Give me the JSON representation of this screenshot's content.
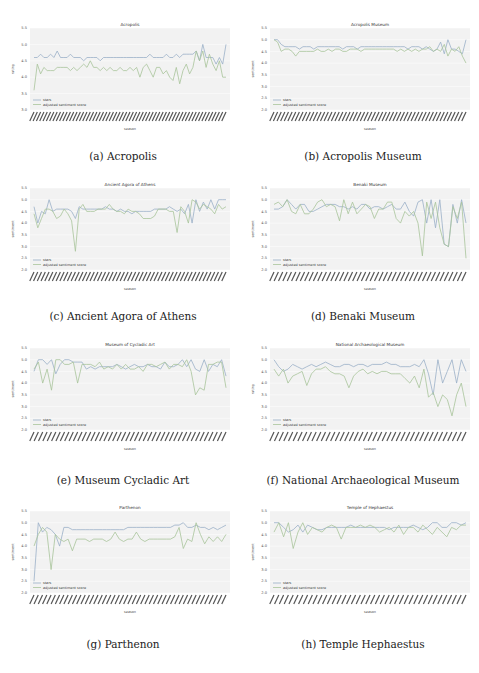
{
  "figure": {
    "panels": [
      {
        "id": "a",
        "caption": "(a) Acropolis",
        "title": "Acropolis",
        "ylabel": "rating",
        "xlabel": "season",
        "legend": [
          "stars",
          "adjusted sentiment score"
        ]
      },
      {
        "id": "b",
        "caption": "(b) Acropolis Museum",
        "title": "Acropolis Museum",
        "ylabel": "sentiment",
        "xlabel": "season",
        "legend": [
          "stars",
          "adjusted sentiment score"
        ]
      },
      {
        "id": "c",
        "caption": "(c) Ancient Agora of Athens",
        "title": "Ancient Agora of Athens",
        "ylabel": "sentiment",
        "xlabel": "season",
        "legend": [
          "stars",
          "adjusted sentiment score"
        ]
      },
      {
        "id": "d",
        "caption": "(d) Benaki Museum",
        "title": "Benaki Museum",
        "ylabel": "sentiment",
        "xlabel": "season",
        "legend": [
          "stars",
          "adjusted sentiment score"
        ]
      },
      {
        "id": "e",
        "caption": "(e) Museum Cycladic Art",
        "title": "Museum of Cycladic Art",
        "ylabel": "sentiment",
        "xlabel": "season",
        "legend": [
          "stars",
          "adjusted sentiment score"
        ]
      },
      {
        "id": "f",
        "caption": "(f) National Archaeological Museum",
        "title": "National Archaeological Museum",
        "ylabel": "rating",
        "xlabel": "season",
        "legend": [
          "stars",
          "adjusted sentiment score"
        ]
      },
      {
        "id": "g",
        "caption": "(g) Parthenon",
        "title": "Parthenon",
        "ylabel": "sentiment",
        "xlabel": "season",
        "legend": [
          "stars",
          "adjusted sentiment score"
        ]
      },
      {
        "id": "h",
        "caption": "(h) Temple Hephaestus",
        "title": "Temple of Hephaestus",
        "ylabel": "sentiment",
        "xlabel": "season",
        "legend": [
          "stars",
          "adjusted sentiment score"
        ]
      }
    ],
    "colors": {
      "stars": "#9ab0c8",
      "sentiment": "#a8c49a",
      "plot_bg": "#f2f2f2",
      "grid": "#ffffff"
    }
  },
  "chart_data": [
    {
      "type": "line",
      "title": "Acropolis",
      "xlabel": "season",
      "ylabel": "rating",
      "ylim": [
        3.0,
        5.5
      ],
      "yticks": [
        3.0,
        3.5,
        4.0,
        4.5,
        5.0,
        5.5
      ],
      "grid": true,
      "legend_position": "lower left",
      "series": [
        {
          "name": "stars",
          "values": [
            4.6,
            4.6,
            4.7,
            4.6,
            4.6,
            4.7,
            4.6,
            4.8,
            4.6,
            4.6,
            4.6,
            4.7,
            4.6,
            4.6,
            4.6,
            4.5,
            4.6,
            4.6,
            4.6,
            4.6,
            4.5,
            4.6,
            4.6,
            4.6,
            4.6,
            4.6,
            4.6,
            4.6,
            4.6,
            4.6,
            4.6,
            4.6,
            4.6,
            4.6,
            4.6,
            4.7,
            4.6,
            4.6,
            4.6,
            4.6,
            4.7,
            4.6,
            4.6,
            4.7,
            4.6,
            4.7,
            4.7,
            4.7,
            4.7,
            4.8,
            4.5,
            5.0,
            4.6,
            4.6,
            4.6,
            4.4,
            4.6,
            4.4,
            5.0
          ]
        },
        {
          "name": "adjusted sentiment score",
          "values": [
            3.6,
            4.4,
            4.1,
            4.3,
            4.2,
            4.2,
            4.2,
            4.3,
            4.3,
            4.3,
            4.3,
            4.2,
            4.3,
            4.2,
            4.3,
            4.4,
            4.3,
            4.5,
            4.3,
            4.3,
            4.2,
            4.3,
            4.2,
            4.3,
            4.2,
            4.2,
            4.3,
            4.2,
            4.2,
            4.3,
            4.2,
            4.3,
            4.0,
            4.3,
            4.4,
            4.2,
            4.0,
            4.3,
            4.3,
            4.1,
            4.2,
            4.0,
            3.9,
            4.3,
            3.8,
            4.2,
            4.4,
            4.1,
            4.3,
            4.8,
            4.5,
            4.8,
            4.3,
            4.7,
            4.4,
            4.2,
            4.5,
            4.0,
            4.0
          ]
        }
      ]
    },
    {
      "type": "line",
      "title": "Acropolis Museum",
      "xlabel": "season",
      "ylabel": "sentiment",
      "ylim": [
        2.0,
        5.5
      ],
      "yticks": [
        2.0,
        2.5,
        3.0,
        3.5,
        4.0,
        4.5,
        5.0,
        5.5
      ],
      "grid": true,
      "legend_position": "lower left",
      "series": [
        {
          "name": "stars",
          "values": [
            5.0,
            5.0,
            4.8,
            4.7,
            4.7,
            4.7,
            4.7,
            4.6,
            4.7,
            4.7,
            4.7,
            4.6,
            4.7,
            4.7,
            4.7,
            4.7,
            4.7,
            4.7,
            4.7,
            4.6,
            4.7,
            4.7,
            4.7,
            4.6,
            4.7,
            4.7,
            4.7,
            4.7,
            4.7,
            4.7,
            4.7,
            4.7,
            4.7,
            4.7,
            4.7,
            4.7,
            4.7,
            4.6,
            4.7,
            4.7,
            4.7,
            4.6,
            4.7,
            4.6,
            4.5,
            4.6,
            4.9,
            4.4,
            5.0,
            4.6,
            4.6,
            4.5,
            4.4,
            5.0
          ]
        },
        {
          "name": "adjusted sentiment score",
          "values": [
            5.0,
            4.9,
            4.5,
            4.6,
            4.6,
            4.5,
            4.3,
            4.5,
            4.5,
            4.5,
            4.5,
            4.5,
            4.6,
            4.5,
            4.5,
            4.6,
            4.5,
            4.6,
            4.6,
            4.5,
            4.5,
            4.6,
            4.6,
            4.6,
            4.5,
            4.6,
            4.6,
            4.6,
            4.6,
            4.6,
            4.6,
            4.6,
            4.6,
            4.6,
            4.5,
            4.6,
            4.5,
            4.6,
            4.5,
            4.6,
            4.5,
            4.6,
            4.6,
            4.7,
            4.5,
            4.6,
            4.5,
            4.8,
            4.3,
            4.6,
            4.5,
            4.7,
            4.3,
            4.0
          ]
        }
      ]
    },
    {
      "type": "line",
      "title": "Ancient Agora of Athens",
      "xlabel": "season",
      "ylabel": "sentiment",
      "ylim": [
        2.0,
        5.5
      ],
      "yticks": [
        2.0,
        2.5,
        3.0,
        3.5,
        4.0,
        4.5,
        5.0,
        5.5
      ],
      "grid": true,
      "legend_position": "lower left",
      "series": [
        {
          "name": "stars",
          "values": [
            4.7,
            4.0,
            4.5,
            4.4,
            5.0,
            4.5,
            4.6,
            4.6,
            4.6,
            4.6,
            4.5,
            4.2,
            4.7,
            4.6,
            4.6,
            4.6,
            4.6,
            4.6,
            4.6,
            4.7,
            4.6,
            4.6,
            4.5,
            4.6,
            4.5,
            4.5,
            4.4,
            4.5,
            4.5,
            4.5,
            4.5,
            4.5,
            4.6,
            4.6,
            4.6,
            4.6,
            4.7,
            4.6,
            4.5,
            4.6,
            4.4,
            4.8,
            4.0,
            5.0,
            4.5,
            4.9,
            4.6,
            5.0,
            4.6,
            5.0,
            5.0,
            5.0
          ]
        },
        {
          "name": "adjusted sentiment score",
          "values": [
            4.4,
            3.8,
            4.2,
            4.6,
            4.6,
            4.5,
            4.2,
            4.3,
            4.6,
            4.4,
            4.1,
            2.8,
            4.6,
            4.8,
            4.5,
            4.5,
            4.5,
            4.6,
            4.6,
            4.6,
            4.8,
            4.6,
            4.5,
            4.5,
            4.4,
            4.6,
            4.5,
            4.5,
            4.4,
            4.2,
            4.2,
            4.2,
            4.3,
            4.6,
            4.6,
            4.6,
            4.5,
            4.5,
            3.6,
            4.7,
            4.5,
            4.0,
            5.0,
            4.9,
            4.6,
            4.8,
            4.7,
            4.6,
            4.4,
            4.8,
            4.6,
            4.7
          ]
        }
      ]
    },
    {
      "type": "line",
      "title": "Benaki Museum",
      "xlabel": "season",
      "ylabel": "sentiment",
      "ylim": [
        2.0,
        5.5
      ],
      "yticks": [
        2.0,
        2.5,
        3.0,
        3.5,
        4.0,
        4.5,
        5.0,
        5.5
      ],
      "grid": true,
      "legend_position": "lower left",
      "series": [
        {
          "name": "stars",
          "values": [
            4.6,
            4.6,
            4.7,
            5.0,
            4.8,
            4.6,
            4.8,
            4.8,
            4.5,
            4.5,
            4.6,
            4.7,
            4.8,
            4.8,
            4.8,
            4.7,
            4.7,
            4.6,
            4.7,
            4.6,
            4.8,
            4.8,
            4.6,
            4.7,
            4.7,
            4.6,
            4.7,
            4.8,
            4.6,
            4.6,
            4.9,
            4.5,
            4.3,
            4.9,
            5.0,
            4.0,
            5.0,
            3.8,
            5.0,
            3.1,
            3.0,
            4.8,
            4.0,
            5.0,
            4.0
          ]
        },
        {
          "name": "adjusted sentiment score",
          "values": [
            4.8,
            4.9,
            4.7,
            5.0,
            4.5,
            4.4,
            4.8,
            4.4,
            4.4,
            4.6,
            4.9,
            5.0,
            4.7,
            4.8,
            4.7,
            4.1,
            5.0,
            4.4,
            4.9,
            4.4,
            4.6,
            4.8,
            4.7,
            4.2,
            4.6,
            4.6,
            4.9,
            4.9,
            4.2,
            4.0,
            4.5,
            4.3,
            4.5,
            4.0,
            2.6,
            4.9,
            4.2,
            4.9,
            3.8,
            3.1,
            3.0,
            4.7,
            4.2,
            4.9,
            2.5
          ]
        }
      ]
    },
    {
      "type": "line",
      "title": "Museum of Cycladic Art",
      "xlabel": "season",
      "ylabel": "sentiment",
      "ylim": [
        2.0,
        5.5
      ],
      "yticks": [
        2.0,
        2.5,
        3.0,
        3.5,
        4.0,
        4.5,
        5.0,
        5.5
      ],
      "grid": true,
      "legend_position": "lower left",
      "series": [
        {
          "name": "stars",
          "values": [
            4.5,
            5.0,
            5.0,
            4.8,
            5.0,
            4.4,
            4.8,
            5.0,
            5.0,
            4.9,
            4.9,
            4.9,
            4.6,
            4.7,
            4.6,
            4.7,
            4.7,
            4.7,
            4.7,
            4.8,
            4.7,
            4.6,
            4.7,
            4.8,
            4.7,
            4.7,
            4.8,
            4.7,
            4.7,
            4.6,
            4.9,
            4.7,
            4.7,
            4.8,
            5.0,
            4.7,
            5.0,
            4.6,
            4.5,
            5.0,
            4.5,
            4.8,
            4.7,
            5.0,
            4.3
          ]
        },
        {
          "name": "adjusted sentiment score",
          "values": [
            4.6,
            4.9,
            4.0,
            4.6,
            3.7,
            5.0,
            5.0,
            4.8,
            4.8,
            4.9,
            4.0,
            4.8,
            4.8,
            4.8,
            4.7,
            4.9,
            4.6,
            4.7,
            4.6,
            4.8,
            4.6,
            4.8,
            4.6,
            4.6,
            4.7,
            4.5,
            4.8,
            4.8,
            4.7,
            4.8,
            4.9,
            4.6,
            4.8,
            4.8,
            4.7,
            5.0,
            4.5,
            3.5,
            3.8,
            3.7,
            4.8,
            4.8,
            4.9,
            4.9,
            3.8
          ]
        }
      ]
    },
    {
      "type": "line",
      "title": "National Archaeological Museum",
      "xlabel": "season",
      "ylabel": "rating",
      "ylim": [
        2.0,
        5.5
      ],
      "yticks": [
        2.0,
        2.5,
        3.0,
        3.5,
        4.0,
        4.5,
        5.0,
        5.5
      ],
      "grid": true,
      "legend_position": "lower left",
      "series": [
        {
          "name": "stars",
          "values": [
            5.0,
            4.7,
            4.5,
            4.6,
            4.8,
            4.7,
            4.6,
            4.7,
            4.8,
            4.7,
            4.8,
            4.9,
            4.8,
            4.7,
            4.7,
            4.8,
            4.8,
            4.7,
            4.8,
            4.8,
            4.7,
            4.8,
            4.8,
            4.8,
            4.9,
            4.8,
            4.8,
            4.7,
            4.7,
            4.7,
            4.8,
            4.7,
            5.0,
            4.4,
            3.5,
            5.0,
            4.0,
            4.5,
            5.0,
            4.0,
            5.0,
            4.5
          ]
        },
        {
          "name": "adjusted sentiment score",
          "values": [
            4.6,
            4.3,
            4.6,
            4.0,
            4.3,
            4.4,
            4.5,
            3.9,
            4.4,
            4.6,
            4.6,
            4.7,
            4.5,
            4.4,
            4.4,
            4.3,
            3.8,
            4.3,
            4.5,
            4.6,
            4.4,
            4.5,
            4.4,
            4.5,
            4.5,
            4.4,
            4.4,
            4.4,
            4.2,
            4.0,
            4.3,
            3.8,
            4.6,
            3.4,
            3.6,
            3.0,
            3.5,
            3.3,
            2.6,
            3.5,
            4.0,
            3.0
          ]
        }
      ]
    },
    {
      "type": "line",
      "title": "Parthenon",
      "xlabel": "season",
      "ylabel": "sentiment",
      "ylim": [
        2.0,
        5.5
      ],
      "yticks": [
        2.0,
        2.5,
        3.0,
        3.5,
        4.0,
        4.5,
        5.0,
        5.5
      ],
      "grid": true,
      "legend_position": "lower left",
      "series": [
        {
          "name": "stars",
          "values": [
            2.5,
            5.0,
            4.6,
            4.8,
            4.7,
            4.5,
            4.0,
            4.8,
            4.8,
            4.7,
            4.7,
            4.7,
            4.7,
            4.7,
            4.7,
            4.7,
            4.7,
            4.7,
            4.7,
            4.7,
            4.7,
            4.7,
            4.8,
            4.8,
            4.8,
            4.8,
            4.8,
            4.8,
            4.8,
            4.8,
            4.8,
            4.8,
            4.8,
            4.9,
            4.9,
            5.0,
            4.8,
            4.8,
            4.9,
            4.8,
            4.8,
            4.7,
            4.8,
            4.7,
            4.8,
            4.9
          ]
        },
        {
          "name": "adjusted sentiment score",
          "values": [
            4.0,
            4.5,
            4.8,
            4.6,
            3.0,
            4.5,
            4.3,
            4.2,
            4.3,
            3.8,
            4.3,
            4.3,
            4.3,
            4.2,
            4.3,
            4.3,
            4.3,
            4.2,
            4.3,
            4.6,
            4.3,
            4.2,
            4.3,
            4.3,
            4.6,
            4.3,
            4.2,
            4.3,
            4.3,
            4.3,
            4.3,
            4.3,
            4.3,
            4.4,
            4.8,
            3.9,
            4.3,
            4.2,
            5.0,
            4.5,
            4.1,
            4.4,
            4.2,
            4.4,
            4.2,
            4.5
          ]
        }
      ]
    },
    {
      "type": "line",
      "title": "Temple of Hephaestus",
      "xlabel": "season",
      "ylabel": "sentiment",
      "ylim": [
        2.0,
        5.5
      ],
      "yticks": [
        2.0,
        2.5,
        3.0,
        3.5,
        4.0,
        4.5,
        5.0,
        5.5
      ],
      "grid": true,
      "legend_position": "lower left",
      "series": [
        {
          "name": "stars",
          "values": [
            5.0,
            5.0,
            4.8,
            4.6,
            4.7,
            4.9,
            4.6,
            4.9,
            4.8,
            4.7,
            4.7,
            4.8,
            4.8,
            4.8,
            4.8,
            4.8,
            4.9,
            4.8,
            4.8,
            4.8,
            4.8,
            4.8,
            4.8,
            4.8,
            4.7,
            4.8,
            4.8,
            4.8,
            4.8,
            4.9,
            4.8,
            4.7,
            4.8,
            5.0,
            5.0,
            4.8,
            4.8,
            5.0,
            5.0,
            4.9,
            5.0
          ]
        },
        {
          "name": "adjusted sentiment score",
          "values": [
            4.6,
            5.0,
            4.4,
            5.0,
            3.9,
            4.6,
            5.0,
            4.5,
            4.8,
            4.7,
            4.6,
            4.8,
            4.9,
            4.8,
            4.3,
            4.8,
            4.8,
            4.8,
            4.9,
            4.8,
            4.9,
            4.8,
            4.6,
            4.7,
            4.8,
            4.6,
            4.9,
            4.5,
            4.8,
            4.8,
            4.6,
            4.9,
            4.7,
            4.5,
            4.8,
            4.6,
            4.4,
            4.8,
            4.7,
            4.9,
            4.9
          ]
        }
      ]
    }
  ]
}
